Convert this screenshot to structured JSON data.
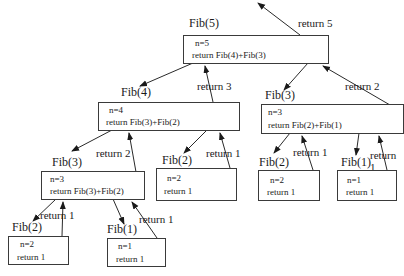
{
  "diagram": {
    "type": "recursion-tree",
    "nodes": [
      {
        "id": "fib5",
        "title": "Fib(5)",
        "line1": "n=5",
        "line2": "return Fib(4)+Fib(3)"
      },
      {
        "id": "fib4",
        "title": "Fib(4)",
        "line1": "n=4",
        "line2": "return Fib(3)+Fib(2)"
      },
      {
        "id": "fib3r",
        "title": "Fib(3)",
        "line1": "n=3",
        "line2": "return Fib(2)+Fib(1)"
      },
      {
        "id": "fib3l",
        "title": "Fib(3)",
        "line1": "n=3",
        "line2": "return Fib(3)+Fib(2)"
      },
      {
        "id": "fib2m",
        "title": "Fib(2)",
        "line1": "n=2",
        "line2": "return 1"
      },
      {
        "id": "fib2r",
        "title": "Fib(2)",
        "line1": "n=2",
        "line2": "return 1"
      },
      {
        "id": "fib1r",
        "title": "Fib(1)",
        "line1": "n=1",
        "line2": "return 1"
      },
      {
        "id": "fib2b",
        "title": "Fib(2)",
        "line1": "n=2",
        "line2": "return 1"
      },
      {
        "id": "fib1b",
        "title": "Fib(1)",
        "line1": "n=1",
        "line2": "return 1"
      }
    ],
    "return_labels": {
      "top": "return 5",
      "fib4_to_fib5": "return 3",
      "fib3r_to_fib5": "return 2",
      "fib3l_to_fib4": "return 2",
      "fib2m_to_fib4": "return 1",
      "fib2r_to_fib3r": "return 1",
      "fib1r_to_fib3r": "return 1",
      "fib2b_to_fib3l": "return 1",
      "fib1b_to_fib3l": "return 1"
    }
  }
}
